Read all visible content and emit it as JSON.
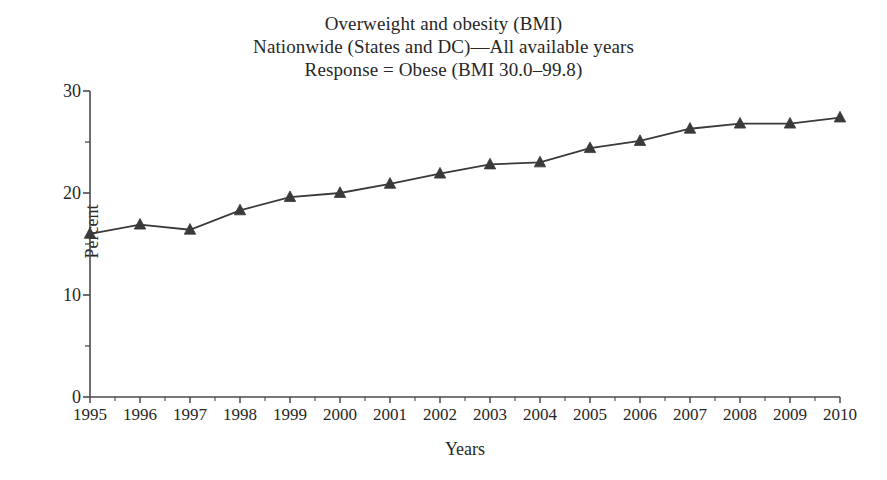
{
  "chart_data": {
    "type": "line",
    "title": "Overweight and obesity (BMI)",
    "subtitle": "Nationwide (States and DC)—All available years",
    "subtitle2": "Response = Obese (BMI 30.0–99.8)",
    "xlabel": "Years",
    "ylabel": "Percent",
    "x": [
      1995,
      1996,
      1997,
      1998,
      1999,
      2000,
      2001,
      2002,
      2003,
      2004,
      2005,
      2006,
      2007,
      2008,
      2009,
      2010
    ],
    "values": [
      16.0,
      16.9,
      16.4,
      18.3,
      19.6,
      20.0,
      20.9,
      21.9,
      22.8,
      23.0,
      24.4,
      25.1,
      26.3,
      26.8,
      26.8,
      27.4
    ],
    "xtick_labels": [
      "1995",
      "1996",
      "1997",
      "1998",
      "1999",
      "2000",
      "2001",
      "2002",
      "2003",
      "2004",
      "2005",
      "2006",
      "2007",
      "2008",
      "2009",
      "2010"
    ],
    "ytick_labels": [
      "0",
      "10",
      "20",
      "30"
    ],
    "ytick_values": [
      0,
      10,
      20,
      30
    ],
    "yminor_values": [
      5,
      15,
      25
    ],
    "ylim": [
      0,
      30
    ],
    "xlim": [
      1995,
      2010
    ],
    "grid": false,
    "legend": null,
    "marker": "triangle",
    "series_color": "#3a3a3a",
    "axis_color": "#4a4a4a",
    "text_color": "#272727"
  }
}
